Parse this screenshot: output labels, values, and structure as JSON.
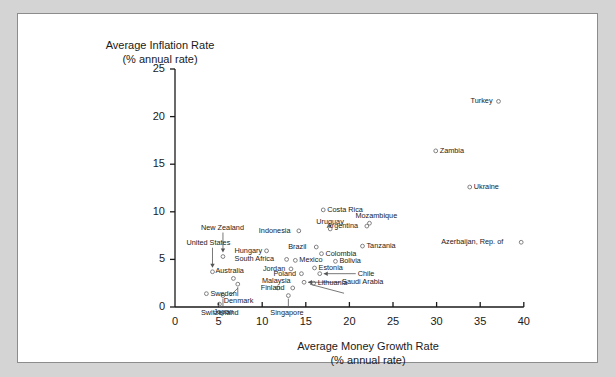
{
  "figure": {
    "background_color": "#d4d4d4",
    "panel_color": "#ffffff",
    "panel_border_color": "#8c8c8c",
    "marker_color": "#808080",
    "axis_color": "#1a1a1a"
  },
  "axis_titles": {
    "y_line1": "Average Inflation Rate",
    "y_line2": "(% annual rate)",
    "x_line1": "Average Money Growth Rate",
    "x_line2": "(% annual rate)"
  },
  "chart_data": {
    "type": "scatter",
    "title": "",
    "xlabel": "Average Money Growth Rate (% annual rate)",
    "ylabel": "Average Inflation Rate (% annual rate)",
    "xlim": [
      0,
      40
    ],
    "ylim": [
      0,
      25
    ],
    "xticks": [
      0,
      5,
      10,
      15,
      20,
      25,
      30,
      35,
      40
    ],
    "yticks": [
      0,
      5,
      10,
      15,
      20,
      25
    ],
    "xtick_labels": [
      "0",
      "5",
      "10",
      "15",
      "20",
      "25",
      "30",
      "35",
      "40"
    ],
    "ytick_labels": [
      "0",
      "5",
      "10",
      "15",
      "20",
      "25"
    ],
    "grid": false,
    "legend": "none",
    "points": [
      {
        "name": "Turkey",
        "x": 37.1,
        "y": 21.6,
        "label_pos": "left"
      },
      {
        "name": "Zambia",
        "x": 29.9,
        "y": 16.4,
        "label_pos": "right"
      },
      {
        "name": "Ukraine",
        "x": 33.8,
        "y": 12.6,
        "label_pos": "right"
      },
      {
        "name": "Azerbaijan, Rep. of",
        "x": 39.7,
        "y": 6.8,
        "label_pos": "left"
      },
      {
        "name": "Costa Rica",
        "x": 17.0,
        "y": 10.2,
        "label_pos": "right"
      },
      {
        "name": "Uruguay",
        "x": 17.8,
        "y": 8.2,
        "label_pos": "above"
      },
      {
        "name": "Mozambique",
        "x": 22.3,
        "y": 8.8,
        "label_pos": "above-right"
      },
      {
        "name": "Argentina",
        "x": 22.0,
        "y": 8.5,
        "label_pos": "left"
      },
      {
        "name": "Indonesia",
        "x": 14.2,
        "y": 8.0,
        "label_pos": "left"
      },
      {
        "name": "Tanzania",
        "x": 21.5,
        "y": 6.4,
        "label_pos": "right"
      },
      {
        "name": "Brazil",
        "x": 16.2,
        "y": 6.3,
        "label_pos": "left"
      },
      {
        "name": "Colombia",
        "x": 16.8,
        "y": 5.6,
        "label_pos": "right"
      },
      {
        "name": "Hungary",
        "x": 10.5,
        "y": 5.9,
        "label_pos": "left"
      },
      {
        "name": "New Zealand",
        "x": 5.5,
        "y": 5.3,
        "label_pos": "leader-down"
      },
      {
        "name": "South Africa",
        "x": 12.8,
        "y": 5.0,
        "label_pos": "left"
      },
      {
        "name": "Mexico",
        "x": 13.8,
        "y": 4.9,
        "label_pos": "right"
      },
      {
        "name": "Bolivia",
        "x": 18.4,
        "y": 4.8,
        "label_pos": "right"
      },
      {
        "name": "Jordan",
        "x": 13.3,
        "y": 4.0,
        "label_pos": "left"
      },
      {
        "name": "Estonia",
        "x": 16.0,
        "y": 4.1,
        "label_pos": "right"
      },
      {
        "name": "United States",
        "x": 4.3,
        "y": 3.7,
        "label_pos": "leader-down"
      },
      {
        "name": "Australia",
        "x": 6.7,
        "y": 3.0,
        "label_pos": "above"
      },
      {
        "name": "Poland",
        "x": 14.5,
        "y": 3.5,
        "label_pos": "left"
      },
      {
        "name": "Chile",
        "x": 16.6,
        "y": 3.5,
        "label_pos": "leader-right"
      },
      {
        "name": "Denmark",
        "x": 7.2,
        "y": 2.4,
        "label_pos": "leader-up"
      },
      {
        "name": "Lithuania",
        "x": 15.9,
        "y": 2.5,
        "label_pos": "right"
      },
      {
        "name": "Saudi Arabia",
        "x": 14.8,
        "y": 2.6,
        "label_pos": "leader-right"
      },
      {
        "name": "Malaysia",
        "x": 11.8,
        "y": 2.0,
        "label_pos": "above"
      },
      {
        "name": "Finland",
        "x": 13.5,
        "y": 2.0,
        "label_pos": "left"
      },
      {
        "name": "Switzerland",
        "x": 5.5,
        "y": 1.2,
        "label_pos": "leader-up"
      },
      {
        "name": "Singapore",
        "x": 13.0,
        "y": 1.2,
        "label_pos": "leader-up"
      },
      {
        "name": "Sweden",
        "x": 3.6,
        "y": 1.4,
        "label_pos": "right"
      },
      {
        "name": "Japan",
        "x": 5.1,
        "y": 0.3,
        "label_pos": "below"
      }
    ]
  }
}
